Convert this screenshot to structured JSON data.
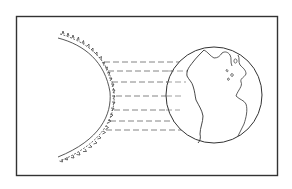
{
  "diagram": {
    "type": "sun-earth-illustration",
    "frame": {
      "x": 16,
      "y": 16,
      "width": 261,
      "height": 159,
      "stroke": "#333333"
    },
    "sun": {
      "label": "",
      "center": [
        -40,
        96
      ],
      "radius": 88,
      "corona": "serrated",
      "stroke": "#333333"
    },
    "rays": {
      "label": "",
      "count": 7,
      "y_positions": [
        62,
        71,
        82,
        96,
        110,
        121,
        130
      ],
      "style": "dashed",
      "stroke": "#555555"
    },
    "earth": {
      "label": "",
      "center": [
        214,
        95
      ],
      "radius": 48,
      "stroke": "#333333",
      "features": [
        "north-america",
        "south-america",
        "europe-africa-edge"
      ]
    }
  }
}
